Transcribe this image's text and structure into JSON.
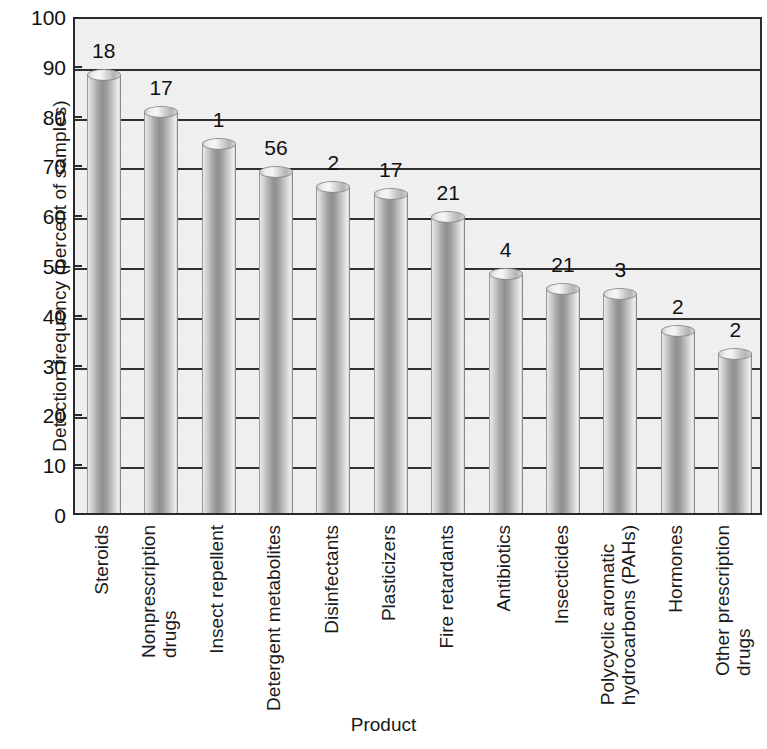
{
  "chart_data": {
    "type": "bar",
    "title": "",
    "xlabel": "Product",
    "ylabel": "Detection frequency (percent of samples)",
    "ylim": [
      0,
      100
    ],
    "ytick_step": 10,
    "yticks": [
      100,
      90,
      80,
      70,
      60,
      50,
      40,
      30,
      20,
      10,
      0
    ],
    "grid": "horizontal",
    "legend": "none",
    "categories": [
      "Steroids",
      "Nonprescription drugs",
      "Insect repellent",
      "Detergent metabolites",
      "Disinfectants",
      "Plasticizers",
      "Fire retardants",
      "Antibiotics",
      "Insecticides",
      "Polycyclic aromatic hydrocarbons (PAHs)",
      "Hormones",
      "Other prescription drugs"
    ],
    "category_lines": [
      [
        "Steroids",
        ""
      ],
      [
        "Nonprescription",
        "drugs"
      ],
      [
        "Insect repellent",
        ""
      ],
      [
        "Detergent metabolites",
        ""
      ],
      [
        "Disinfectants",
        ""
      ],
      [
        "Plasticizers",
        ""
      ],
      [
        "Fire retardants",
        ""
      ],
      [
        "Antibiotics",
        ""
      ],
      [
        "Insecticides",
        ""
      ],
      [
        "Polycyclic aromatic",
        "hydrocarbons (PAHs)"
      ],
      [
        "Hormones",
        ""
      ],
      [
        "Other prescription",
        "drugs"
      ]
    ],
    "values": [
      88,
      80.5,
      74,
      68.5,
      65.5,
      64,
      59.5,
      48,
      45,
      44,
      36.5,
      32
    ],
    "bar_labels": [
      "18",
      "17",
      "1",
      "56",
      "2",
      "17",
      "21",
      "4",
      "21",
      "3",
      "2",
      "2"
    ],
    "bar_label_meaning": "number of compounds in group (annotation above each bar)"
  },
  "axis": {
    "y_title": "Detection frequency (percent of samples)",
    "x_title": "Product"
  },
  "colors": {
    "plot_background": "#f0f0f0",
    "axis_line": "#2a2a2a",
    "gridline": "#2f2f2f",
    "bar_light": "#efefef",
    "bar_dark": "#8f8f8f",
    "text": "#111111"
  }
}
